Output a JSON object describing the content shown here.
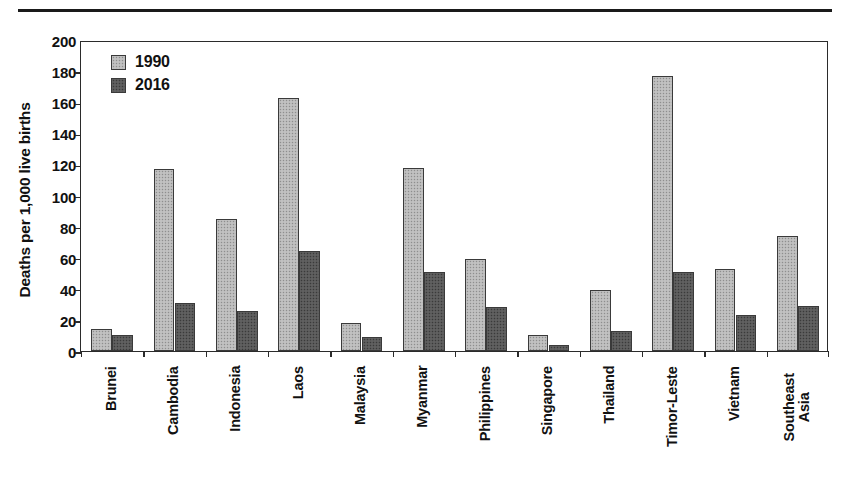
{
  "figure": {
    "top_rule": "horizontal-rule",
    "background_color": "#ffffff"
  },
  "chart_data": {
    "type": "bar",
    "title": "",
    "xlabel": "",
    "ylabel": "Deaths per 1,000 live births",
    "ylim": [
      0,
      200
    ],
    "ytick_step": 20,
    "yticks": [
      0,
      20,
      40,
      60,
      80,
      100,
      120,
      140,
      160,
      180,
      200
    ],
    "grid": false,
    "legend_position": "top-left",
    "categories": [
      "Brunei",
      "Cambodia",
      "Indonesia",
      "Laos",
      "Malaysia",
      "Myanmar",
      "Philippines",
      "Singapore",
      "Thailand",
      "Timor-Leste",
      "Vietnam",
      "Southeast\nAsia"
    ],
    "series": [
      {
        "name": "1990",
        "color": "#b9b9b9",
        "values": [
          14,
          117,
          85,
          163,
          18,
          118,
          59,
          10,
          39,
          177,
          53,
          74
        ]
      },
      {
        "name": "2016",
        "color": "#585858",
        "values": [
          10,
          31,
          26,
          64,
          9,
          51,
          28,
          4,
          13,
          51,
          23,
          29
        ]
      }
    ]
  }
}
